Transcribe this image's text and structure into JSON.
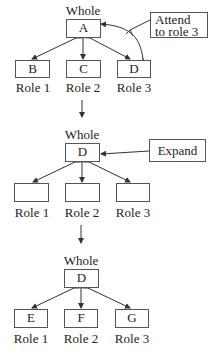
{
  "stages": [
    {
      "parent": {
        "caption": "Whole",
        "label": "A"
      },
      "children": [
        {
          "label": "B",
          "role": "Role 1"
        },
        {
          "label": "C",
          "role": "Role 2"
        },
        {
          "label": "D",
          "role": "Role 3"
        }
      ],
      "note": {
        "line1": "Attend",
        "line2": "to role 3"
      }
    },
    {
      "parent": {
        "caption": "Whole",
        "label": "D"
      },
      "children": [
        {
          "label": "",
          "role": "Role 1"
        },
        {
          "label": "",
          "role": "Role 2"
        },
        {
          "label": "",
          "role": "Role 3"
        }
      ],
      "note": {
        "line1": "Expand"
      }
    },
    {
      "parent": {
        "caption": "Whole",
        "label": "D"
      },
      "children": [
        {
          "label": "E",
          "role": "Role 1"
        },
        {
          "label": "F",
          "role": "Role 2"
        },
        {
          "label": "G",
          "role": "Role 3"
        }
      ]
    }
  ]
}
